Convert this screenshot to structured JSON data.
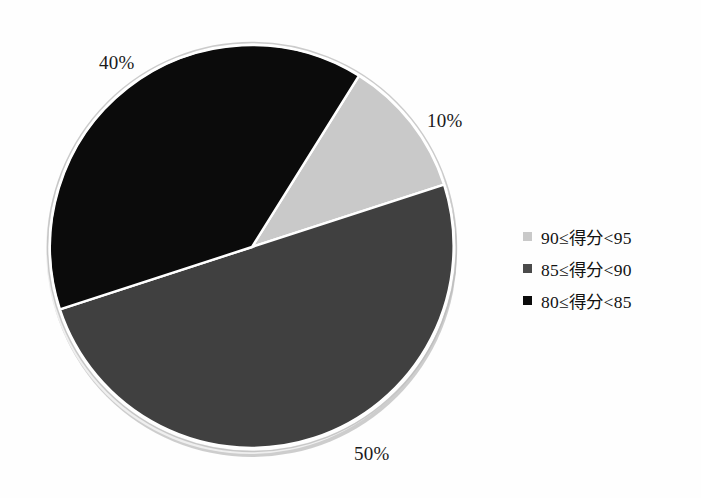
{
  "chart_data": {
    "type": "pie",
    "title": "",
    "subtitle": "",
    "xlabel": "",
    "ylabel": "",
    "grid": false,
    "legend_position": "right",
    "categories": [
      "90≤得分<95",
      "85≤得分<90",
      "80≤得分<85"
    ],
    "values": [
      10,
      50,
      40
    ],
    "value_unit": "%",
    "data_labels": [
      "10%",
      "50%",
      "40%"
    ],
    "colors": [
      "#c9c9c9",
      "#404040",
      "#0b0b0b"
    ],
    "start_angle_deg": -58,
    "slices": [
      {
        "label": "90≤得分<95",
        "value": 10,
        "data_label": "10%",
        "color": "#c9c9c9",
        "start_deg": -58,
        "end_deg": -18
      },
      {
        "label": "85≤得分<90",
        "value": 50,
        "data_label": "50%",
        "color": "#404040",
        "start_deg": -18,
        "end_deg": 162
      },
      {
        "label": "80≤得分<85",
        "value": 40,
        "data_label": "40%",
        "color": "#0b0b0b",
        "start_deg": 162,
        "end_deg": 302
      }
    ]
  },
  "labels": {
    "pct_40": "40%",
    "pct_10": "10%",
    "pct_50": "50%"
  },
  "legend": {
    "items": [
      {
        "label": "90≤得分<95",
        "color": "#c9c9c9"
      },
      {
        "label": "85≤得分<90",
        "color": "#4a4a4a"
      },
      {
        "label": "80≤得分<85",
        "color": "#0b0b0b"
      }
    ]
  },
  "colors": {
    "background": "#fefefe",
    "slice_light": "#c9c9c9",
    "slice_dark": "#404040",
    "slice_black": "#0b0b0b",
    "separator": "#ffffff",
    "rim_shadow": "#b6b6b6"
  }
}
